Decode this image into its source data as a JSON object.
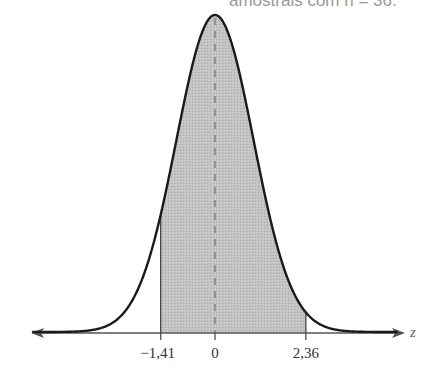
{
  "caption": "amostrais com n = 36.",
  "chart_data": {
    "type": "area",
    "xlabel": "z",
    "ylabel": "",
    "shaded_region": {
      "from": -1.41,
      "to": 2.36
    },
    "center_line": {
      "x": 0,
      "style": "dashed"
    },
    "tick_labels": [
      "-1,41",
      "0",
      "2,36"
    ],
    "tick_values": [
      -1.41,
      0,
      2.36
    ],
    "xlim": [
      -5.0,
      5.0
    ],
    "grid": false,
    "legend": "none"
  },
  "axis": {
    "variable": "z"
  },
  "ticks": [
    {
      "label": "−1,41",
      "value": -1.41
    },
    {
      "label": "0",
      "value": 0
    },
    {
      "label": "2,36",
      "value": 2.36
    }
  ],
  "colors": {
    "curve": "#1a1a1a",
    "shade": "#bdbdbd",
    "axis": "#555555",
    "dashed": "#777777"
  }
}
